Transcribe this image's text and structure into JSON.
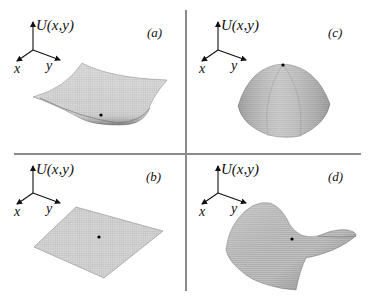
{
  "figure": {
    "layout": "2x2 grid of surface plots separated by cross-shaped divider lines",
    "axis_label": "U(x,y)",
    "axis_label_parts": {
      "func": "U",
      "args": "(x,y)"
    },
    "x_axis_label": "x",
    "y_axis_label": "y",
    "panels": [
      {
        "id": "a",
        "label": "(a)",
        "position": "top-left",
        "surface": "bowl (minimum)",
        "marked_point": "minimum at bottom of bowl"
      },
      {
        "id": "c",
        "label": "(c)",
        "position": "top-right",
        "surface": "dome (maximum)",
        "marked_point": "maximum at apex of dome"
      },
      {
        "id": "b",
        "label": "(b)",
        "position": "bottom-left",
        "surface": "flat plane",
        "marked_point": "point on flat plane"
      },
      {
        "id": "d",
        "label": "(d)",
        "position": "bottom-right",
        "surface": "saddle",
        "marked_point": "saddle point"
      }
    ],
    "colors": {
      "surface_fill": "#d4d4d4",
      "surface_mesh": "#7d7d7d",
      "divider": "#8a8a8a",
      "ink": "#111111"
    }
  }
}
